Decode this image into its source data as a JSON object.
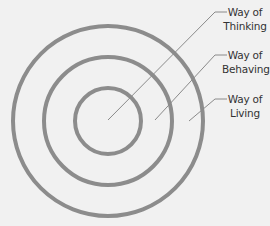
{
  "diagram": {
    "type": "concentric-circles",
    "colors": {
      "background": "#f1f1f1",
      "ring_stroke": "#8c8c8c",
      "leader_stroke": "#8a8a8a",
      "text": "#333333"
    },
    "rings": [
      {
        "name": "inner",
        "label_line1": "Way of",
        "label_line2": "Thinking"
      },
      {
        "name": "middle",
        "label_line1": "Way of",
        "label_line2": "Behaving"
      },
      {
        "name": "outer",
        "label_line1": "Way of",
        "label_line2": "Living"
      }
    ]
  }
}
